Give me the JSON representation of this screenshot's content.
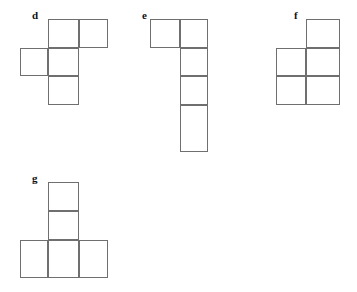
{
  "page": {
    "background_color": "#ffffff",
    "line_color": "#6f6f6f",
    "label_color": "#111111",
    "width": 357,
    "height": 292
  },
  "figures": [
    {
      "id": "d",
      "label": "d",
      "label_x": 32,
      "label_y": 10,
      "description": "cross-like hexomino net",
      "cell_size": 29,
      "cells": [
        {
          "x": 48,
          "y": 19,
          "w": 31,
          "h": 29
        },
        {
          "x": 79,
          "y": 19,
          "w": 29,
          "h": 29
        },
        {
          "x": 20,
          "y": 48,
          "w": 28,
          "h": 28
        },
        {
          "x": 48,
          "y": 48,
          "w": 31,
          "h": 28
        },
        {
          "x": 48,
          "y": 76,
          "w": 31,
          "h": 29
        }
      ]
    },
    {
      "id": "e",
      "label": "e",
      "label_x": 142,
      "label_y": 10,
      "description": "vertical column of four with one cell left at top",
      "cell_size": 29,
      "cells": [
        {
          "x": 150,
          "y": 19,
          "w": 30,
          "h": 29
        },
        {
          "x": 180,
          "y": 19,
          "w": 28,
          "h": 29
        },
        {
          "x": 180,
          "y": 48,
          "w": 28,
          "h": 28
        },
        {
          "x": 180,
          "y": 76,
          "w": 28,
          "h": 29
        },
        {
          "x": 180,
          "y": 105,
          "w": 28,
          "h": 47
        }
      ]
    },
    {
      "id": "f",
      "label": "f",
      "label_x": 294,
      "label_y": 10,
      "description": "two by two block with one cell atop the right column",
      "cell_size": 29,
      "cells": [
        {
          "x": 306,
          "y": 19,
          "w": 34,
          "h": 29
        },
        {
          "x": 276,
          "y": 48,
          "w": 30,
          "h": 28
        },
        {
          "x": 306,
          "y": 48,
          "w": 34,
          "h": 28
        },
        {
          "x": 276,
          "y": 76,
          "w": 30,
          "h": 29
        },
        {
          "x": 306,
          "y": 76,
          "w": 34,
          "h": 29
        }
      ]
    },
    {
      "id": "g",
      "label": "g",
      "label_x": 32,
      "label_y": 173,
      "description": "T shape, two stacked cells above a row of three",
      "cell_size": 29,
      "cells": [
        {
          "x": 48,
          "y": 182,
          "w": 31,
          "h": 29
        },
        {
          "x": 48,
          "y": 211,
          "w": 31,
          "h": 29
        },
        {
          "x": 20,
          "y": 240,
          "w": 28,
          "h": 38
        },
        {
          "x": 48,
          "y": 240,
          "w": 31,
          "h": 38
        },
        {
          "x": 79,
          "y": 240,
          "w": 29,
          "h": 38
        }
      ]
    }
  ]
}
